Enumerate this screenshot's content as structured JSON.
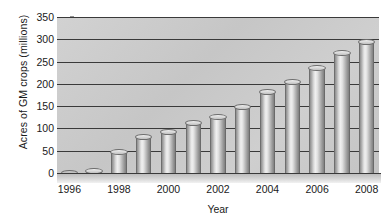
{
  "chart_data": {
    "type": "bar",
    "title": "",
    "xlabel": "Year",
    "ylabel": "Acres of GM crops (millions)",
    "categories": [
      "1996",
      "1997",
      "1998",
      "1999",
      "2000",
      "2001",
      "2002",
      "2003",
      "2004",
      "2005",
      "2006",
      "2007",
      "2008"
    ],
    "values": [
      2,
      12,
      55,
      88,
      98,
      118,
      132,
      155,
      188,
      212,
      242,
      275,
      300
    ],
    "ylim": [
      0,
      350
    ],
    "ytick_values": [
      0,
      50,
      100,
      150,
      200,
      250,
      300,
      350
    ],
    "ytick_labels": [
      "0",
      "50",
      "100",
      "150",
      "200",
      "250",
      "300",
      "350"
    ],
    "xtick_labels": [
      "1996",
      "1998",
      "2000",
      "2002",
      "2004",
      "2006",
      "2008"
    ],
    "xtick_indices": [
      0,
      2,
      4,
      6,
      8,
      10,
      12
    ],
    "grid": true,
    "legend": false,
    "style": "3d-cylinder",
    "colors": {
      "plot_background": "#c8c8c8",
      "gridline": "#3a3a3a",
      "bar_light": "#f0f0f0",
      "bar_mid": "#c4c4c4",
      "bar_dark": "#808080",
      "text": "#1a1a1a"
    }
  }
}
